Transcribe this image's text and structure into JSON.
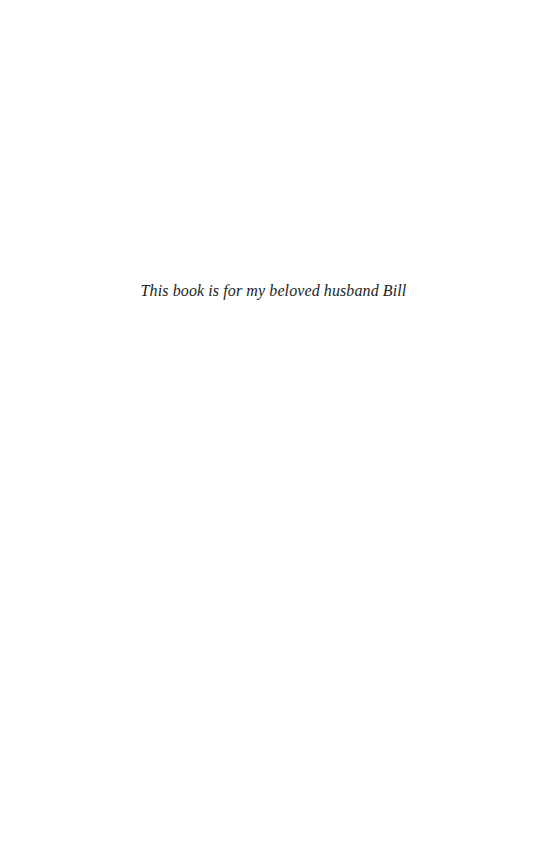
{
  "page": {
    "dedication": "This book is for my beloved husband Bill"
  }
}
